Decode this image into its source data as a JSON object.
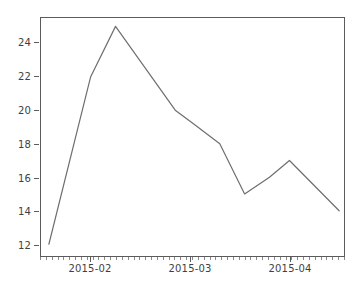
{
  "chart_data": {
    "type": "line",
    "title": "",
    "xlabel": "",
    "ylabel": "",
    "x": [
      "2015-01-25",
      "2015-02-01",
      "2015-02-05",
      "2015-02-15",
      "2015-02-24",
      "2015-03-07",
      "2015-03-14",
      "2015-03-25",
      "2015-04-05",
      "2015-04-22"
    ],
    "values": [
      12,
      22,
      25,
      20,
      19,
      18,
      15,
      16,
      17,
      14
    ],
    "series": [
      {
        "name": "series-1",
        "values": [
          12,
          22,
          25,
          20,
          19,
          18,
          15,
          16,
          17,
          14
        ]
      }
    ],
    "points": [
      {
        "x_frac": 0.026,
        "y": 12
      },
      {
        "x_frac": 0.164,
        "y": 22
      },
      {
        "x_frac": 0.246,
        "y": 25
      },
      {
        "x_frac": 0.443,
        "y": 20
      },
      {
        "x_frac": 0.502,
        "y": 19.2
      },
      {
        "x_frac": 0.59,
        "y": 18
      },
      {
        "x_frac": 0.672,
        "y": 15
      },
      {
        "x_frac": 0.754,
        "y": 16
      },
      {
        "x_frac": 0.82,
        "y": 17
      },
      {
        "x_frac": 0.984,
        "y": 14
      }
    ],
    "ylim": [
      11.3,
      25.5
    ],
    "xlim_labels": [
      "2015-02",
      "2015-03",
      "2015-04"
    ],
    "yticks": [
      12,
      14,
      16,
      18,
      20,
      22,
      24
    ],
    "ytick_labels": [
      "12",
      "14",
      "16",
      "18",
      "20",
      "22",
      "24"
    ],
    "xticks": [
      {
        "label": "2015-02",
        "x_frac": 0.164
      },
      {
        "label": "2015-03",
        "x_frac": 0.492
      },
      {
        "label": "2015-04",
        "x_frac": 0.82
      }
    ],
    "xtick_minor_count": 52,
    "grid": false,
    "legend": null,
    "legend_position": "none",
    "line_color": "#6e6e6e",
    "line_width": 1.2,
    "axes_color": "#5b5b5b",
    "background_color": "#ffffff",
    "tick_label_color": "#3f3f3f"
  }
}
